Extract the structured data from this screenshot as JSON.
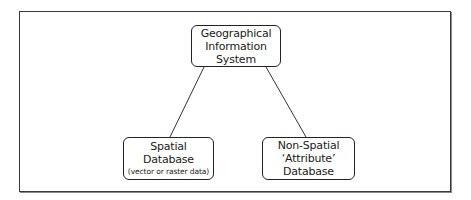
{
  "diagram": {
    "type": "hierarchy",
    "nodes": [
      {
        "id": "gis",
        "lines": [
          "Geographical",
          "Information",
          "System"
        ]
      },
      {
        "id": "spatial",
        "lines": [
          "Spatial",
          "Database"
        ],
        "note": "(vector or raster data)"
      },
      {
        "id": "nonspatial",
        "lines": [
          "Non-Spatial",
          "‘Attribute’",
          "Database"
        ]
      }
    ],
    "edges": [
      {
        "from": "gis",
        "to": "spatial"
      },
      {
        "from": "gis",
        "to": "nonspatial"
      }
    ],
    "colors": {
      "stroke": "#222222",
      "background": "#ffffff"
    }
  }
}
